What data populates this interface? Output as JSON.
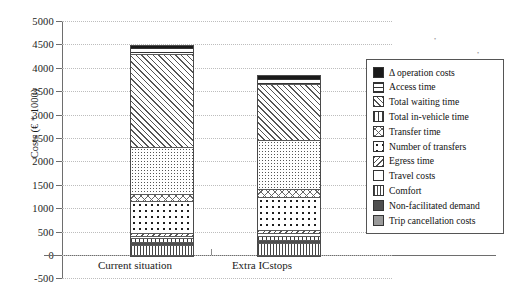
{
  "chart_data": {
    "type": "bar",
    "subtype": "stacked-vertical",
    "title": "",
    "xlabel": "",
    "ylabel": "Costs (€ * 1000)",
    "ylim": [
      -500,
      5000
    ],
    "ytick_step": 500,
    "yticks": [
      "5000",
      "4500",
      "4000",
      "3500",
      "3000",
      "2500",
      "2000",
      "1500",
      "1000",
      "500",
      "0",
      "-500"
    ],
    "categories": [
      "Current situation",
      "Extra ICstops"
    ],
    "grid": "horizontal-dotted",
    "legend_position": "right",
    "series": [
      {
        "name": "Trip cancellation costs",
        "pattern": "vertical-bars",
        "values": [
          215,
          250
        ]
      },
      {
        "name": "Non-facilitated demand",
        "pattern": "solid-dark-gray",
        "values": [
          60,
          65
        ]
      },
      {
        "name": "Comfort",
        "pattern": "vertical-thick-bars",
        "values": [
          95,
          100
        ]
      },
      {
        "name": "Travel costs",
        "pattern": "white",
        "values": [
          45,
          50
        ]
      },
      {
        "name": "Egress time",
        "pattern": "back-diagonal",
        "values": [
          60,
          65
        ]
      },
      {
        "name": "Number of transfers",
        "pattern": "dots",
        "values": [
          670,
          700
        ]
      },
      {
        "name": "Transfer time",
        "pattern": "cross-hatch",
        "values": [
          160,
          170
        ]
      },
      {
        "name": "Total in-vehicle time",
        "pattern": "fine-stipple",
        "values": [
          1000,
          1050
        ]
      },
      {
        "name": "Total waiting time",
        "pattern": "diagonal",
        "values": [
          2000,
          1200
        ]
      },
      {
        "name": "Access time",
        "pattern": "horizontal-bars",
        "values": [
          130,
          140
        ]
      },
      {
        "name": "Δ operation costs",
        "pattern": "solid-black",
        "values": [
          45,
          50
        ]
      }
    ],
    "totals": [
      4480,
      3840
    ]
  },
  "legend": {
    "items": [
      {
        "label": "Δ operation costs",
        "swatch": "solid-black"
      },
      {
        "label": "Access time",
        "swatch": "horizontal-bars"
      },
      {
        "label": "Total waiting time",
        "swatch": "diagonal"
      },
      {
        "label": "Total in-vehicle time",
        "swatch": "vertical-thick-bars"
      },
      {
        "label": "Transfer time",
        "swatch": "cross-hatch"
      },
      {
        "label": "Number of transfers",
        "swatch": "dots"
      },
      {
        "label": "Egress time",
        "swatch": "back-diagonal"
      },
      {
        "label": "Travel costs",
        "swatch": "white"
      },
      {
        "label": "Comfort",
        "swatch": "vertical-bars"
      },
      {
        "label": "Non-facilitated demand",
        "swatch": "solid-dark-gray"
      },
      {
        "label": "Trip cancellation costs",
        "swatch": "solid-mid-gray"
      }
    ]
  },
  "colors": {
    "axis": "#6e6e6e",
    "grid": "#bdbdbd",
    "text": "#1a1a1a",
    "legend_border": "#555555"
  }
}
